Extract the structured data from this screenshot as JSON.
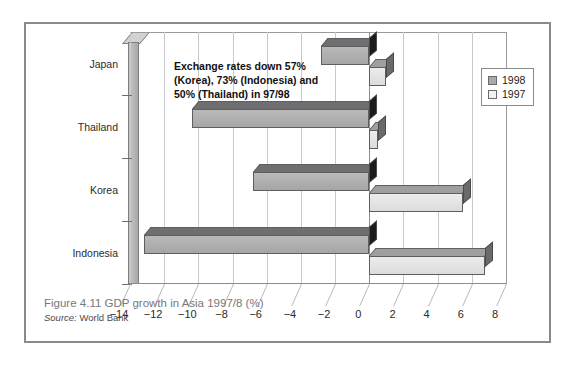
{
  "figure": {
    "caption_title": "Figure 4.11  GDP growth in Asia 1997/8 (%)",
    "source_label": "Source:",
    "source_value": "World Bank"
  },
  "annotation": {
    "text": "Exchange rates down 57% (Korea), 73% (Indonesia) and 50% (Thailand) in 97/98"
  },
  "legend": {
    "items": [
      {
        "label": "1998",
        "color": "#a9a9a9"
      },
      {
        "label": "1997",
        "color": "#f2f2f2"
      }
    ]
  },
  "chart_data": {
    "type": "bar",
    "orientation": "horizontal",
    "title": "Figure 4.11  GDP growth in Asia 1997/8 (%)",
    "xlabel": "",
    "ylabel": "",
    "xlim": [
      -14,
      8
    ],
    "xticks": [
      "-14",
      "-12",
      "-10",
      "-8",
      "-6",
      "-4",
      "-2",
      "0",
      "2",
      "4",
      "6",
      "8"
    ],
    "xtick_values": [
      -14,
      -12,
      -10,
      -8,
      -6,
      -4,
      -2,
      0,
      2,
      4,
      6,
      8
    ],
    "categories": [
      "Japan",
      "Thailand",
      "Korea",
      "Indonesia"
    ],
    "grid": "vertical",
    "legend_position": "top-right",
    "series": [
      {
        "name": "1998",
        "color": "#a9a9a9",
        "values": [
          -2.8,
          -10.4,
          -6.8,
          -13.2
        ]
      },
      {
        "name": "1997",
        "color": "#f2f2f2",
        "values": [
          1.0,
          0.5,
          5.5,
          6.8
        ]
      }
    ],
    "annotations": [
      "Exchange rates down 57% (Korea), 73% (Indonesia) and 50% (Thailand) in 97/98"
    ]
  }
}
